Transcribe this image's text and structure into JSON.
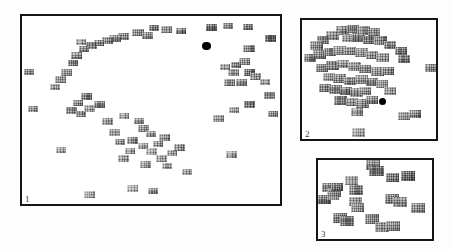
{
  "figure": {
    "kind": "image-scatter-panels",
    "background_color": "#fdfdfd",
    "panel_border_color": "#141414",
    "panel_fill_color": "#ffffff",
    "marker_color": "#000000"
  },
  "panels": [
    {
      "label": "1",
      "name": "panel-1",
      "x": 20,
      "y": 14,
      "w": 262,
      "h": 192,
      "marker": {
        "x": 0.715,
        "y": 0.158,
        "r": 4.2
      },
      "point_count": 300
    },
    {
      "label": "2",
      "name": "panel-2",
      "x": 300,
      "y": 18,
      "w": 138,
      "h": 123,
      "marker": {
        "x": 0.598,
        "y": 0.682,
        "r": 3.6
      },
      "point_count": 96
    },
    {
      "label": "3",
      "name": "panel-3",
      "x": 316,
      "y": 158,
      "w": 118,
      "h": 83,
      "marker": null,
      "point_count": 21
    }
  ],
  "chart_data": {
    "type": "scatter",
    "title": "",
    "xlabel": "",
    "ylabel": "",
    "xlim": [
      0,
      1
    ],
    "ylim": [
      0,
      1
    ],
    "grid": false,
    "legend": null,
    "annotations": [
      "1",
      "2",
      "3"
    ],
    "series": [
      {
        "name": "panel-1-thumbnails",
        "panel": "1",
        "glyph": "image-thumbnail",
        "points": [
          [
            0.735,
            0.06,
            11,
            7,
            0.52
          ],
          [
            0.8,
            0.055,
            10,
            6,
            0.6
          ],
          [
            0.875,
            0.06,
            10,
            6,
            0.55
          ],
          [
            0.56,
            0.072,
            11,
            7,
            0.42
          ],
          [
            0.615,
            0.08,
            10,
            6,
            0.48
          ],
          [
            0.45,
            0.09,
            12,
            7,
            0.45
          ],
          [
            0.485,
            0.105,
            11,
            7,
            0.4
          ],
          [
            0.512,
            0.066,
            10,
            6,
            0.5
          ],
          [
            0.392,
            0.108,
            11,
            7,
            0.44
          ],
          [
            0.36,
            0.12,
            12,
            7,
            0.38
          ],
          [
            0.33,
            0.132,
            11,
            7,
            0.42
          ],
          [
            0.3,
            0.145,
            10,
            6,
            0.4
          ],
          [
            0.27,
            0.158,
            11,
            7,
            0.46
          ],
          [
            0.24,
            0.175,
            10,
            6,
            0.44
          ],
          [
            0.962,
            0.118,
            11,
            7,
            0.55
          ],
          [
            0.88,
            0.175,
            12,
            7,
            0.48
          ],
          [
            0.228,
            0.14,
            10,
            6,
            0.5
          ],
          [
            0.21,
            0.208,
            11,
            7,
            0.44
          ],
          [
            0.196,
            0.252,
            10,
            6,
            0.42
          ],
          [
            0.172,
            0.3,
            11,
            7,
            0.4
          ],
          [
            0.15,
            0.34,
            11,
            7,
            0.44
          ],
          [
            0.128,
            0.38,
            10,
            6,
            0.46
          ],
          [
            0.026,
            0.3,
            10,
            6,
            0.5
          ],
          [
            0.958,
            0.42,
            11,
            7,
            0.5
          ],
          [
            0.042,
            0.492,
            10,
            6,
            0.48
          ],
          [
            0.88,
            0.3,
            11,
            7,
            0.46
          ],
          [
            0.905,
            0.322,
            11,
            7,
            0.44
          ],
          [
            0.94,
            0.352,
            10,
            6,
            0.42
          ],
          [
            0.82,
            0.298,
            11,
            7,
            0.4
          ],
          [
            0.852,
            0.355,
            11,
            7,
            0.43
          ],
          [
            0.788,
            0.27,
            10,
            6,
            0.41
          ],
          [
            0.805,
            0.352,
            11,
            7,
            0.39
          ],
          [
            0.83,
            0.262,
            10,
            6,
            0.45
          ],
          [
            0.862,
            0.242,
            11,
            7,
            0.47
          ],
          [
            0.25,
            0.43,
            11,
            7,
            0.4
          ],
          [
            0.215,
            0.462,
            10,
            6,
            0.38
          ],
          [
            0.192,
            0.5,
            11,
            7,
            0.42
          ],
          [
            0.228,
            0.52,
            10,
            6,
            0.4
          ],
          [
            0.26,
            0.492,
            11,
            7,
            0.36
          ],
          [
            0.3,
            0.47,
            11,
            7,
            0.38
          ],
          [
            0.88,
            0.47,
            11,
            7,
            0.44
          ],
          [
            0.82,
            0.5,
            10,
            6,
            0.4
          ],
          [
            0.972,
            0.52,
            10,
            6,
            0.46
          ],
          [
            0.76,
            0.545,
            11,
            7,
            0.34
          ],
          [
            0.33,
            0.56,
            11,
            7,
            0.32
          ],
          [
            0.152,
            0.712,
            10,
            6,
            0.28
          ],
          [
            0.392,
            0.76,
            11,
            7,
            0.24
          ],
          [
            0.48,
            0.79,
            11,
            7,
            0.22
          ],
          [
            0.56,
            0.8,
            10,
            6,
            0.26
          ],
          [
            0.81,
            0.735,
            11,
            7,
            0.24
          ],
          [
            0.43,
            0.918,
            11,
            7,
            0.2
          ],
          [
            0.508,
            0.93,
            10,
            6,
            0.22
          ],
          [
            0.262,
            0.95,
            11,
            7,
            0.2
          ],
          [
            0.64,
            0.828,
            10,
            6,
            0.24
          ],
          [
            0.455,
            0.56,
            10,
            6,
            0.36
          ],
          [
            0.47,
            0.6,
            11,
            7,
            0.3
          ],
          [
            0.5,
            0.63,
            10,
            6,
            0.28
          ],
          [
            0.43,
            0.66,
            11,
            7,
            0.26
          ],
          [
            0.468,
            0.69,
            10,
            6,
            0.24
          ],
          [
            0.5,
            0.72,
            11,
            7,
            0.28
          ],
          [
            0.525,
            0.68,
            10,
            6,
            0.3
          ],
          [
            0.552,
            0.648,
            11,
            7,
            0.32
          ],
          [
            0.42,
            0.72,
            10,
            6,
            0.22
          ],
          [
            0.54,
            0.76,
            11,
            7,
            0.26
          ],
          [
            0.58,
            0.73,
            10,
            6,
            0.3
          ],
          [
            0.61,
            0.7,
            11,
            7,
            0.34
          ],
          [
            0.395,
            0.53,
            10,
            6,
            0.34
          ],
          [
            0.36,
            0.62,
            11,
            7,
            0.3
          ],
          [
            0.378,
            0.672,
            10,
            6,
            0.26
          ]
        ]
      },
      {
        "name": "panel-2-thumbnails",
        "panel": "2",
        "glyph": "image-thumbnail",
        "points": [
          [
            0.3,
            0.09,
            13,
            9,
            0.52
          ],
          [
            0.38,
            0.072,
            12,
            8,
            0.48
          ],
          [
            0.46,
            0.085,
            13,
            9,
            0.45
          ],
          [
            0.54,
            0.1,
            12,
            8,
            0.5
          ],
          [
            0.225,
            0.13,
            13,
            9,
            0.46
          ],
          [
            0.16,
            0.17,
            12,
            8,
            0.52
          ],
          [
            0.105,
            0.21,
            13,
            9,
            0.5
          ],
          [
            0.34,
            0.155,
            12,
            8,
            0.42
          ],
          [
            0.42,
            0.148,
            13,
            9,
            0.44
          ],
          [
            0.5,
            0.168,
            12,
            8,
            0.46
          ],
          [
            0.585,
            0.175,
            13,
            9,
            0.42
          ],
          [
            0.655,
            0.21,
            12,
            8,
            0.48
          ],
          [
            0.735,
            0.258,
            12,
            8,
            0.5
          ],
          [
            0.76,
            0.33,
            12,
            8,
            0.46
          ],
          [
            0.96,
            0.4,
            12,
            8,
            0.54
          ],
          [
            0.062,
            0.318,
            12,
            8,
            0.52
          ],
          [
            0.13,
            0.29,
            13,
            9,
            0.46
          ],
          [
            0.205,
            0.268,
            12,
            8,
            0.44
          ],
          [
            0.28,
            0.252,
            13,
            9,
            0.4
          ],
          [
            0.36,
            0.262,
            12,
            8,
            0.42
          ],
          [
            0.44,
            0.275,
            13,
            9,
            0.44
          ],
          [
            0.52,
            0.29,
            12,
            8,
            0.4
          ],
          [
            0.6,
            0.318,
            13,
            9,
            0.42
          ],
          [
            0.15,
            0.4,
            12,
            8,
            0.46
          ],
          [
            0.225,
            0.385,
            13,
            9,
            0.42
          ],
          [
            0.305,
            0.372,
            12,
            8,
            0.4
          ],
          [
            0.39,
            0.39,
            13,
            9,
            0.38
          ],
          [
            0.47,
            0.41,
            12,
            8,
            0.42
          ],
          [
            0.56,
            0.43,
            13,
            9,
            0.44
          ],
          [
            0.64,
            0.425,
            12,
            8,
            0.4
          ],
          [
            0.2,
            0.48,
            12,
            8,
            0.44
          ],
          [
            0.28,
            0.495,
            13,
            9,
            0.4
          ],
          [
            0.36,
            0.512,
            12,
            8,
            0.42
          ],
          [
            0.44,
            0.5,
            13,
            9,
            0.38
          ],
          [
            0.52,
            0.52,
            12,
            8,
            0.4
          ],
          [
            0.6,
            0.54,
            12,
            8,
            0.42
          ],
          [
            0.175,
            0.57,
            12,
            8,
            0.46
          ],
          [
            0.25,
            0.585,
            13,
            9,
            0.42
          ],
          [
            0.33,
            0.6,
            12,
            8,
            0.4
          ],
          [
            0.408,
            0.612,
            13,
            9,
            0.38
          ],
          [
            0.47,
            0.595,
            12,
            8,
            0.42
          ],
          [
            0.66,
            0.6,
            12,
            8,
            0.44
          ],
          [
            0.29,
            0.672,
            13,
            9,
            0.4
          ],
          [
            0.37,
            0.688,
            12,
            8,
            0.38
          ],
          [
            0.45,
            0.7,
            13,
            9,
            0.4
          ],
          [
            0.52,
            0.672,
            12,
            8,
            0.42
          ],
          [
            0.408,
            0.772,
            12,
            8,
            0.34
          ],
          [
            0.76,
            0.81,
            12,
            8,
            0.36
          ],
          [
            0.84,
            0.79,
            12,
            8,
            0.38
          ],
          [
            0.42,
            0.945,
            13,
            9,
            0.3
          ]
        ]
      },
      {
        "name": "panel-3-thumbnails",
        "panel": "3",
        "glyph": "image-thumbnail",
        "points": [
          [
            0.48,
            0.06,
            14,
            10,
            0.5
          ],
          [
            0.51,
            0.135,
            15,
            10,
            0.46
          ],
          [
            0.655,
            0.215,
            13,
            9,
            0.48
          ],
          [
            0.79,
            0.2,
            14,
            10,
            0.52
          ],
          [
            0.29,
            0.265,
            13,
            9,
            0.5
          ],
          [
            0.095,
            0.35,
            13,
            9,
            0.46
          ],
          [
            0.145,
            0.405,
            13,
            9,
            0.44
          ],
          [
            0.33,
            0.375,
            14,
            10,
            0.48
          ],
          [
            0.06,
            0.505,
            13,
            9,
            0.42
          ],
          [
            0.33,
            0.52,
            13,
            9,
            0.46
          ],
          [
            0.645,
            0.49,
            14,
            10,
            0.44
          ],
          [
            0.715,
            0.53,
            14,
            10,
            0.46
          ],
          [
            0.345,
            0.6,
            13,
            9,
            0.42
          ],
          [
            0.88,
            0.61,
            14,
            10,
            0.48
          ],
          [
            0.195,
            0.73,
            14,
            10,
            0.44
          ],
          [
            0.255,
            0.775,
            14,
            10,
            0.42
          ],
          [
            0.47,
            0.74,
            14,
            10,
            0.46
          ],
          [
            0.56,
            0.845,
            14,
            10,
            0.44
          ],
          [
            0.66,
            0.835,
            14,
            10,
            0.46
          ],
          [
            0.165,
            0.345,
            12,
            8,
            0.44
          ],
          [
            0.13,
            0.455,
            12,
            8,
            0.42
          ]
        ]
      }
    ]
  }
}
